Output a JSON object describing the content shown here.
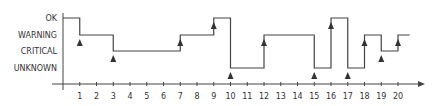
{
  "chart_data": {
    "type": "line",
    "subtype": "step",
    "title": "",
    "xlabel": "",
    "ylabel": "",
    "y_categories": [
      "UNKNOWN",
      "CRITICAL",
      "WARNING",
      "OK"
    ],
    "x_ticks": [
      1,
      2,
      3,
      4,
      5,
      6,
      7,
      8,
      9,
      10,
      11,
      12,
      13,
      14,
      15,
      16,
      17,
      18,
      19,
      20
    ],
    "xlim": [
      0,
      21
    ],
    "grid": false,
    "legend": null,
    "series": [
      {
        "name": "state",
        "points": [
          {
            "x": 0,
            "state": "OK"
          },
          {
            "x": 1,
            "state": "WARNING"
          },
          {
            "x": 3,
            "state": "CRITICAL"
          },
          {
            "x": 7,
            "state": "WARNING"
          },
          {
            "x": 9,
            "state": "OK"
          },
          {
            "x": 10,
            "state": "UNKNOWN"
          },
          {
            "x": 12,
            "state": "WARNING"
          },
          {
            "x": 15,
            "state": "UNKNOWN"
          },
          {
            "x": 16,
            "state": "OK"
          },
          {
            "x": 17,
            "state": "UNKNOWN"
          },
          {
            "x": 18,
            "state": "WARNING"
          },
          {
            "x": 19,
            "state": "CRITICAL"
          },
          {
            "x": 20,
            "state": "WARNING"
          }
        ],
        "end_x": 20.7
      }
    ],
    "annotations": {
      "marker": "triangle-up",
      "event_x": [
        1,
        3,
        7,
        9,
        10,
        12,
        15,
        16,
        17,
        18,
        19,
        20
      ]
    }
  },
  "axis_labels": {
    "ok": "OK",
    "warning": "WARNING",
    "critical": "CRITICAL",
    "unknown": "UNKNOWN"
  },
  "colors": {
    "line": "#444444",
    "axis": "#444444",
    "marker": "#333333",
    "text": "#333333"
  }
}
